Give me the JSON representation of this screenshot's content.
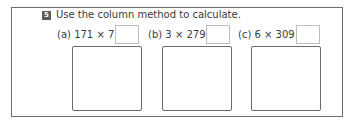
{
  "exercise": {
    "number": "5",
    "instruction": "Use the column method to calculate."
  },
  "problems": [
    {
      "label": "(a)",
      "expression": "171 × 7 =",
      "answer": ""
    },
    {
      "label": "(b)",
      "expression": "3 × 279 =",
      "answer": ""
    },
    {
      "label": "(c)",
      "expression": "6 × 309 =",
      "answer": ""
    }
  ],
  "colors": {
    "badge_bg": "#5a5a5a",
    "text": "#3a3a3a",
    "frame_border": "#6e6e6e",
    "answer_box_border": "#bdbdbd"
  }
}
